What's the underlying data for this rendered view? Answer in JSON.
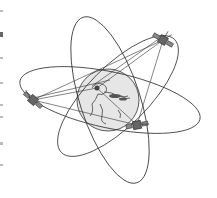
{
  "figure": {
    "colors": {
      "line": "#333333",
      "globe_fill": "#e6e6e6",
      "land": "#555555",
      "background": "#ffffff"
    },
    "globe": {
      "cx": 108,
      "cy": 100,
      "r": 31
    },
    "orbits": [
      {
        "name": "polar-orbit",
        "cx": 110,
        "cy": 100,
        "rx": 30,
        "ry": 87,
        "rotate": -18
      },
      {
        "name": "equatorial-orbit",
        "cx": 110,
        "cy": 100,
        "rx": 92,
        "ry": 28,
        "rotate": 12
      },
      {
        "name": "inclined-orbit",
        "cx": 118,
        "cy": 96,
        "rx": 80,
        "ry": 30,
        "rotate": -45
      }
    ],
    "satellites": [
      {
        "name": "satellite-top-right",
        "x": 163,
        "y": 40
      },
      {
        "name": "satellite-left",
        "x": 33,
        "y": 100
      },
      {
        "name": "satellite-bottom-right",
        "x": 137,
        "y": 125
      }
    ],
    "ground_station": {
      "x": 97,
      "y": 88
    }
  }
}
